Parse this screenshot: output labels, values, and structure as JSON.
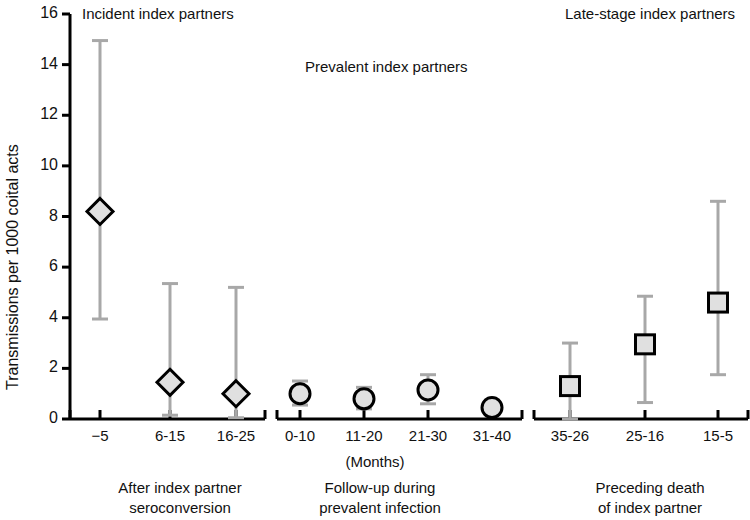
{
  "figure": {
    "y_axis_title": "Transmissions per 1000 coital acts",
    "months_label": "(Months)",
    "panel_titles": {
      "incident": "Incident index partners",
      "prevalent": "Prevalent index partners",
      "late_stage": "Late-stage index partners"
    }
  },
  "chart_data": {
    "type": "scatter",
    "title": "",
    "subtitle": "",
    "xlabel": "(Months)",
    "ylabel": "Transmissions per 1000 coital acts",
    "ylim": [
      0,
      16
    ],
    "yticks": [
      0,
      2,
      4,
      6,
      8,
      10,
      12,
      14,
      16
    ],
    "ytick_labels": [
      "0",
      "2",
      "4",
      "6",
      "8",
      "10",
      "12",
      "14",
      "16"
    ],
    "grid": false,
    "legend": "none",
    "error_bars": "95% CI (vertical, capped)",
    "colors": {
      "marker_fill": "#e0e0e0",
      "marker_edge": "#000000",
      "error_bar": "#a8a8a8",
      "axis": "#000000",
      "text": "#111111"
    },
    "groups": [
      {
        "name": "Incident index partners",
        "caption": "After index partner seroconversion",
        "marker": "diamond",
        "categories": [
          "−5",
          "6-15",
          "16-25"
        ],
        "values": [
          8.2,
          1.45,
          1.0
        ],
        "ci_low": [
          3.95,
          0.15,
          0.05
        ],
        "ci_high": [
          14.95,
          5.35,
          5.2
        ]
      },
      {
        "name": "Prevalent index partners",
        "caption": "Follow-up during prevalent infection",
        "marker": "circle",
        "categories": [
          "0-10",
          "11-20",
          "21-30",
          "31-40"
        ],
        "values": [
          1.0,
          0.8,
          1.15,
          0.45
        ],
        "ci_low": [
          0.55,
          0.4,
          0.6,
          0.2
        ],
        "ci_high": [
          1.5,
          1.25,
          1.75,
          0.75
        ]
      },
      {
        "name": "Late-stage index partners",
        "caption": "Preceding death of index partner",
        "marker": "square",
        "categories": [
          "35-26",
          "25-16",
          "15-5"
        ],
        "values": [
          1.3,
          2.95,
          4.6
        ],
        "ci_low": [
          0.0,
          0.65,
          1.75
        ],
        "ci_high": [
          3.0,
          4.85,
          8.6
        ]
      }
    ]
  },
  "captions": {
    "group1_line1": "After index partner",
    "group1_line2": "seroconversion",
    "group2_line1": "Follow-up during",
    "group2_line2": "prevalent infection",
    "group3_line1": "Preceding death",
    "group3_line2": "of index partner"
  }
}
